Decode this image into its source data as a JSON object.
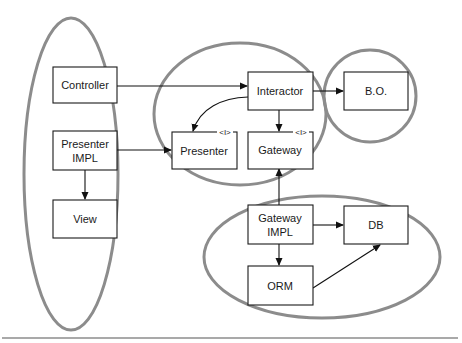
{
  "diagram": {
    "colors": {
      "ellipse_stroke": "#8c8c8c",
      "box_stroke": "#1a1a1a",
      "background": "#ffffff"
    },
    "groups": [
      {
        "id": "ui-group",
        "members": [
          "Controller",
          "Presenter IMPL",
          "View"
        ]
      },
      {
        "id": "usecase-group",
        "members": [
          "Interactor",
          "Presenter",
          "Gateway"
        ]
      },
      {
        "id": "entity-group",
        "members": [
          "B.O."
        ]
      },
      {
        "id": "data-group",
        "members": [
          "Gateway IMPL",
          "DB",
          "ORM"
        ]
      }
    ],
    "nodes": {
      "controller": {
        "label": "Controller"
      },
      "presenter_impl": {
        "line1": "Presenter",
        "line2": "IMPL"
      },
      "view": {
        "label": "View"
      },
      "interactor": {
        "label": "Interactor"
      },
      "presenter": {
        "label": "Presenter",
        "marker": "<I>"
      },
      "gateway": {
        "label": "Gateway",
        "marker": "<I>"
      },
      "bo": {
        "label": "B.O."
      },
      "gateway_impl": {
        "line1": "Gateway",
        "line2": "IMPL"
      },
      "db": {
        "label": "DB"
      },
      "orm": {
        "label": "ORM"
      }
    },
    "edges": [
      {
        "from": "Controller",
        "to": "Interactor"
      },
      {
        "from": "Presenter IMPL",
        "to": "Presenter"
      },
      {
        "from": "Presenter IMPL",
        "to": "View"
      },
      {
        "from": "Interactor",
        "to": "B.O."
      },
      {
        "from": "Interactor",
        "to": "Presenter"
      },
      {
        "from": "Interactor",
        "to": "Gateway"
      },
      {
        "from": "Gateway IMPL",
        "to": "Gateway"
      },
      {
        "from": "Gateway IMPL",
        "to": "DB"
      },
      {
        "from": "Gateway IMPL",
        "to": "ORM"
      },
      {
        "from": "ORM",
        "to": "DB"
      }
    ]
  }
}
